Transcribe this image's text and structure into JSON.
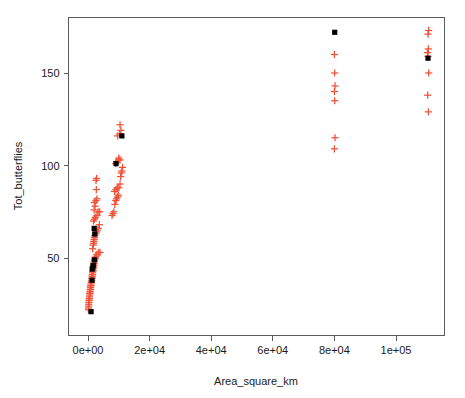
{
  "chart_data": {
    "type": "scatter",
    "title": "",
    "xlabel": "Area_square_km",
    "ylabel": "Tot_butterflies",
    "xlim": [
      -5000,
      116000
    ],
    "ylim": [
      18,
      176
    ],
    "grid": false,
    "legend": false,
    "xticks": [
      0,
      20000,
      40000,
      60000,
      80000,
      100000
    ],
    "xticklabels": [
      "0e+00",
      "2e+04",
      "4e+04",
      "6e+04",
      "8e+04",
      "1e+05"
    ],
    "yticks": [
      50,
      100,
      150
    ],
    "yticklabels": [
      "50",
      "100",
      "150"
    ],
    "series": [
      {
        "name": "red-cross-points",
        "marker": "plus",
        "color": "#ef5138",
        "points": [
          [
            150,
            22
          ],
          [
            170,
            23
          ],
          [
            200,
            24
          ],
          [
            250,
            25
          ],
          [
            300,
            26
          ],
          [
            350,
            27
          ],
          [
            400,
            28
          ],
          [
            450,
            28
          ],
          [
            500,
            29
          ],
          [
            560,
            30
          ],
          [
            600,
            31
          ],
          [
            650,
            31
          ],
          [
            700,
            32
          ],
          [
            760,
            33
          ],
          [
            800,
            33
          ],
          [
            850,
            34
          ],
          [
            900,
            35
          ],
          [
            950,
            35
          ],
          [
            1000,
            36
          ],
          [
            1100,
            37
          ],
          [
            1150,
            37
          ],
          [
            1200,
            38
          ],
          [
            1250,
            39
          ],
          [
            1300,
            39
          ],
          [
            1350,
            40
          ],
          [
            1400,
            41
          ],
          [
            1450,
            41
          ],
          [
            1500,
            42
          ],
          [
            1550,
            43
          ],
          [
            1600,
            43
          ],
          [
            1650,
            44
          ],
          [
            1700,
            45
          ],
          [
            1750,
            45
          ],
          [
            1800,
            46
          ],
          [
            1850,
            46
          ],
          [
            1900,
            47
          ],
          [
            1950,
            47
          ],
          [
            2000,
            48
          ],
          [
            2100,
            49
          ],
          [
            2200,
            49
          ],
          [
            2300,
            50
          ],
          [
            2400,
            50
          ],
          [
            2600,
            51
          ],
          [
            2900,
            52
          ],
          [
            3400,
            53
          ],
          [
            3900,
            53
          ],
          [
            1500,
            55
          ],
          [
            1700,
            57
          ],
          [
            1800,
            58
          ],
          [
            1900,
            59
          ],
          [
            2000,
            60
          ],
          [
            2100,
            61
          ],
          [
            2200,
            62
          ],
          [
            2500,
            63
          ],
          [
            2700,
            64
          ],
          [
            3000,
            65
          ],
          [
            3300,
            66
          ],
          [
            3700,
            68
          ],
          [
            1800,
            70
          ],
          [
            2100,
            71
          ],
          [
            2400,
            72
          ],
          [
            2900,
            73
          ],
          [
            3300,
            75
          ],
          [
            3800,
            75
          ],
          [
            2000,
            76
          ],
          [
            2300,
            78
          ],
          [
            2100,
            80
          ],
          [
            2600,
            81
          ],
          [
            2900,
            82
          ],
          [
            7800,
            73
          ],
          [
            8100,
            74
          ],
          [
            8400,
            75
          ],
          [
            8700,
            79
          ],
          [
            9000,
            81
          ],
          [
            9200,
            82
          ],
          [
            9600,
            83
          ],
          [
            9900,
            84
          ],
          [
            8600,
            86
          ],
          [
            9100,
            87
          ],
          [
            9500,
            88
          ],
          [
            10000,
            88
          ],
          [
            10400,
            90
          ],
          [
            2700,
            87
          ],
          [
            2600,
            92
          ],
          [
            2800,
            93
          ],
          [
            10600,
            94
          ],
          [
            10800,
            96
          ],
          [
            11000,
            97
          ],
          [
            11200,
            99
          ],
          [
            9000,
            101
          ],
          [
            9300,
            102
          ],
          [
            9900,
            103
          ],
          [
            10400,
            103
          ],
          [
            10000,
            104
          ],
          [
            9600,
            116
          ],
          [
            10300,
            117
          ],
          [
            10700,
            119
          ],
          [
            10400,
            122
          ],
          [
            80000,
            109
          ],
          [
            80200,
            115
          ],
          [
            80100,
            135
          ],
          [
            80000,
            140
          ],
          [
            80200,
            143
          ],
          [
            80100,
            150
          ],
          [
            80000,
            160
          ],
          [
            110500,
            129
          ],
          [
            110300,
            138
          ],
          [
            110600,
            150
          ],
          [
            110400,
            159
          ],
          [
            110200,
            161
          ],
          [
            110500,
            163
          ],
          [
            110400,
            171
          ],
          [
            110600,
            173
          ]
        ]
      },
      {
        "name": "black-square-points",
        "marker": "square",
        "color": "#000000",
        "points": [
          [
            1000,
            21
          ],
          [
            1300,
            38
          ],
          [
            1400,
            44
          ],
          [
            1600,
            45
          ],
          [
            1700,
            46
          ],
          [
            2100,
            49
          ],
          [
            2200,
            63
          ],
          [
            2000,
            66
          ],
          [
            9100,
            101
          ],
          [
            11000,
            116
          ],
          [
            80100,
            172
          ],
          [
            110400,
            158
          ]
        ]
      }
    ]
  },
  "axes": {
    "x_axis_label": "Area_square_km",
    "y_axis_label": "Tot_butterflies",
    "x_tick_labels": [
      "0e+00",
      "2e+04",
      "4e+04",
      "6e+04",
      "8e+04",
      "1e+05"
    ],
    "y_tick_labels": [
      "50",
      "100",
      "150"
    ]
  },
  "colors": {
    "marker_red": "#ef5138",
    "marker_black": "#000000",
    "axis": "#5a5a5a",
    "background": "#ffffff"
  }
}
